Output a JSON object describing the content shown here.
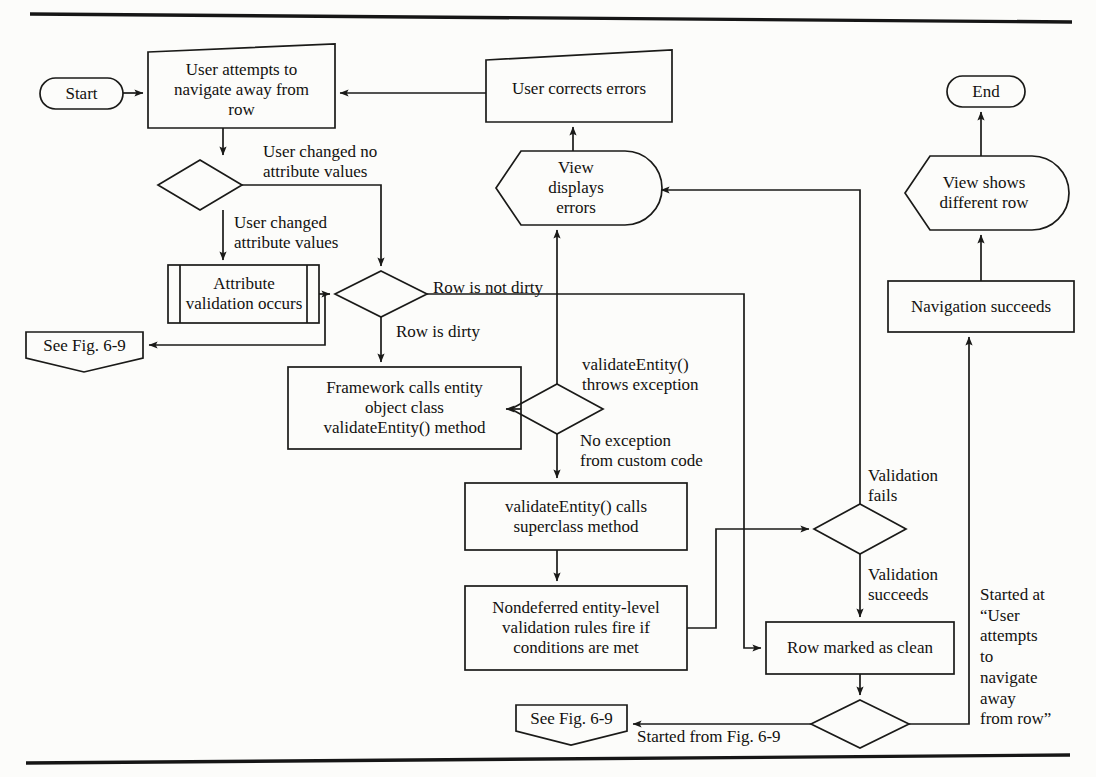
{
  "figure": {
    "stroke_color": "#1a1a18",
    "text_color": "#12110f",
    "background_color": "#fcfcfa",
    "rule_color": "#161616"
  },
  "nodes": {
    "start": {
      "label": "Start",
      "shape": "terminator"
    },
    "user_attempts": {
      "label": "User attempts to\nnavigate away from\nrow",
      "shape": "process-skewed"
    },
    "decision_changed": {
      "label": "",
      "shape": "decision"
    },
    "attribute_validation": {
      "label": "Attribute\nvalidation occurs",
      "shape": "predefined-process"
    },
    "see_fig_69_top": {
      "label": "See Fig. 6-9",
      "shape": "off-page-connector"
    },
    "decision_dirty": {
      "label": "",
      "shape": "decision"
    },
    "framework_calls": {
      "label": "Framework calls entity\nobject class\nvalidateEntity() method",
      "shape": "process"
    },
    "decision_exception": {
      "label": "",
      "shape": "decision"
    },
    "validate_entity_calls": {
      "label": "validateEntity() calls\nsuperclass method",
      "shape": "process"
    },
    "nondeferred_rules": {
      "label": "Nondeferred entity-level\nvalidation rules fire if\nconditions are met",
      "shape": "process"
    },
    "see_fig_69_bottom": {
      "label": "See Fig. 6-9",
      "shape": "off-page-connector"
    },
    "decision_validation": {
      "label": "",
      "shape": "decision"
    },
    "row_marked_clean": {
      "label": "Row marked as clean",
      "shape": "process"
    },
    "decision_started": {
      "label": "",
      "shape": "decision"
    },
    "view_displays_errors": {
      "label": "View\ndisplays\nerrors",
      "shape": "display"
    },
    "user_corrects_errors": {
      "label": "User corrects errors",
      "shape": "process-skewed"
    },
    "navigation_succeeds": {
      "label": "Navigation succeeds",
      "shape": "process"
    },
    "view_shows_different_row": {
      "label": "View shows\ndifferent row",
      "shape": "display"
    },
    "end": {
      "label": "End",
      "shape": "terminator"
    }
  },
  "edge_labels": {
    "user_changed_no": "User changed no\nattribute values",
    "user_changed_yes": "User changed\nattribute values",
    "row_is_not_dirty": "Row is not dirty",
    "row_is_dirty": "Row is dirty",
    "throws_exception": "validateEntity()\nthrows exception",
    "no_exception": "No exception\nfrom custom code",
    "validation_fails": "Validation\nfails",
    "validation_succeeds": "Validation\nsucceeds",
    "started_from_fig": "Started from Fig. 6-9",
    "started_at_user": "Started at\n“User\nattempts\nto\nnavigate\naway\nfrom row”"
  }
}
